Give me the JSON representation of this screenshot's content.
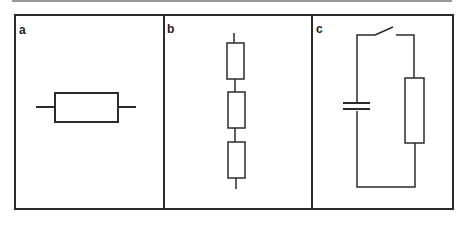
{
  "figure": {
    "panels": [
      {
        "id": "a",
        "label": "a",
        "description": "single resistor symbol (horizontal)"
      },
      {
        "id": "b",
        "label": "b",
        "description": "three resistors in series (vertical)"
      },
      {
        "id": "c",
        "label": "c",
        "description": "circuit with open switch, capacitor and resistor in a loop"
      }
    ]
  },
  "colors": {
    "line": "#2b2b2b",
    "background": "#ffffff",
    "top_rule": "#9a9a9a"
  }
}
